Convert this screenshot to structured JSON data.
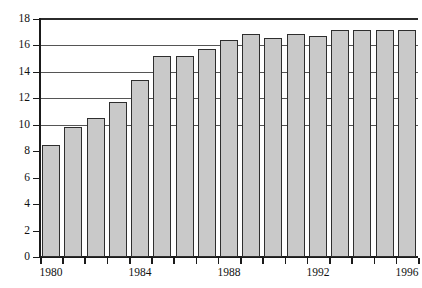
{
  "chart_data": {
    "type": "bar",
    "title": "",
    "subtitle": "",
    "xlabel": "",
    "ylabel": "",
    "categories": [
      1980,
      1981,
      1982,
      1983,
      1984,
      1985,
      1986,
      1987,
      1988,
      1989,
      1990,
      1991,
      1992,
      1993,
      1994,
      1995,
      1996
    ],
    "values": [
      8.5,
      9.8,
      10.5,
      11.7,
      13.4,
      15.2,
      15.2,
      15.7,
      16.4,
      16.9,
      16.6,
      16.9,
      16.7,
      17.2,
      17.2,
      17.2,
      17.2
    ],
    "series": [
      {
        "name": "",
        "values": [
          8.5,
          9.8,
          10.5,
          11.7,
          13.4,
          15.2,
          15.2,
          15.7,
          16.4,
          16.9,
          16.6,
          16.9,
          16.7,
          17.2,
          17.2,
          17.2,
          17.2
        ]
      }
    ],
    "ylim": [
      0,
      18
    ],
    "xlim": [
      1979.5,
      1996.5
    ],
    "ytick_values": [
      0,
      2,
      4,
      6,
      8,
      10,
      12,
      14,
      16,
      18
    ],
    "ytick_labels": [
      "0",
      "2",
      "4",
      "6",
      "8",
      "10",
      "12",
      "14",
      "16",
      "18"
    ],
    "xtick_labels": [
      "1980",
      "1984",
      "1988",
      "1992",
      "1996"
    ],
    "xtick_label_years": [
      1980,
      1984,
      1988,
      1992,
      1996
    ],
    "gridlines_y": [
      10,
      12,
      14,
      16,
      18
    ],
    "grid": true,
    "legend": false,
    "legend_position": "none",
    "bar_fill_color": "#c9c9c9",
    "bar_edge_color": "#2e2e2e",
    "axis_color": "#1a1a1a",
    "grid_color": "#555555",
    "background_color": "#ffffff"
  }
}
